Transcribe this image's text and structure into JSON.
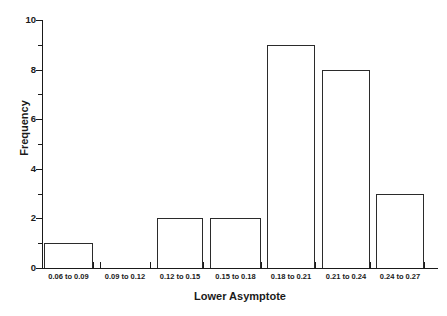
{
  "chart_data": {
    "type": "bar",
    "title": "",
    "subtitle": "",
    "xlabel": "Lower Asymptote",
    "ylabel": "Frequency",
    "categories": [
      "0.06 to 0.09",
      "0.09 to 0.12",
      "0.12 to 0.15",
      "0.15 to 0.18",
      "0.18 to 0.21",
      "0.21 to 0.24",
      "0.24 to 0.27"
    ],
    "values": [
      1,
      0,
      2,
      2,
      9,
      8,
      3
    ],
    "xlim": [
      0.06,
      0.27
    ],
    "ylim": [
      0,
      10
    ],
    "y_ticks": [
      0,
      2,
      4,
      6,
      8,
      10
    ],
    "y_tick_labels": [
      "0",
      "2",
      "4",
      "6",
      "8",
      "10"
    ],
    "y_minor_ticks": [
      1,
      3,
      5,
      7,
      9
    ],
    "grid": false,
    "legend": false,
    "legend_position": "none",
    "bar_fill_color": "#ffffff",
    "bar_edge_color": "#2b2b2b",
    "axis_color": "#1a1a1a",
    "background_color": "#ffffff",
    "annotations": []
  },
  "axes": {
    "x_title": "Lower Asymptote",
    "y_title": "Frequency"
  }
}
